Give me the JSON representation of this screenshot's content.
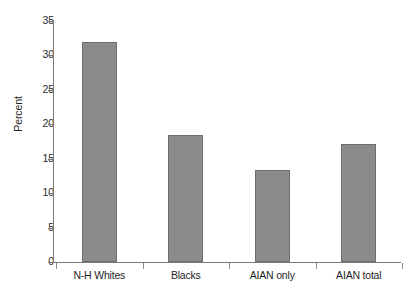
{
  "chart_data": {
    "type": "bar",
    "title": "",
    "xlabel": "",
    "ylabel": "Percent",
    "categories": [
      "N-H Whites",
      "Blacks",
      "AIAN only",
      "AIAN total"
    ],
    "values": [
      32.0,
      18.4,
      13.4,
      17.2
    ],
    "ylim": [
      0,
      35
    ],
    "ytick_step": 5,
    "yticks": [
      "35",
      "30",
      "25",
      "20",
      "15",
      "10",
      "5",
      "0"
    ],
    "grid": false,
    "legend": false,
    "bar_color": "#8b8b8b",
    "bar_border_color": "#6d6d6d",
    "axis_color": "#7a7a7a",
    "background": "#ffffff"
  }
}
